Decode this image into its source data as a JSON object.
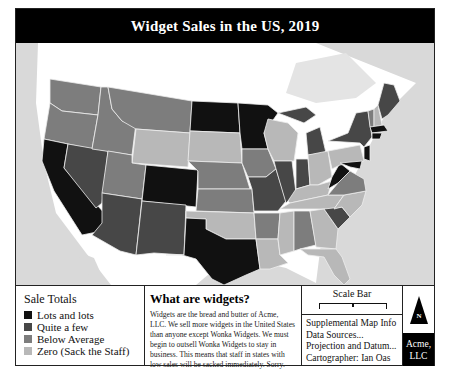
{
  "title": "Widget Sales in the US, 2019",
  "colors": {
    "lots": "#111111",
    "quite": "#474747",
    "below": "#7d7d7d",
    "zero": "#b8b8b8",
    "water": "#d9d9d9",
    "land_other": "#ffffff"
  },
  "legend": {
    "title": "Sale Totals",
    "items": [
      {
        "label": "Lots and lots",
        "color": "#111111"
      },
      {
        "label": "Quite a few",
        "color": "#474747"
      },
      {
        "label": "Below Average",
        "color": "#7d7d7d"
      },
      {
        "label": "Zero (Sack the Staff)",
        "color": "#b8b8b8"
      }
    ]
  },
  "about": {
    "title": "What are widgets?",
    "body": "Widgets are the bread and butter of Acme, LLC. We sell more widgets in the United States than anyone except Wonka Widgets. We must begin to outsell Wonka Widgets to stay in business. This means that staff in states with low sales will be sacked immediately. Sorry."
  },
  "scale_bar": {
    "label": "Scale Bar"
  },
  "supplemental": {
    "lines": [
      "Supplemental Map Info",
      "Data Sources...",
      "Projection and Datum...",
      "Cartographer: Ian Oas"
    ]
  },
  "north_arrow": {
    "label": "N"
  },
  "company": {
    "line1": "Acme,",
    "line2": "LLC"
  },
  "states": {
    "WA": "below",
    "OR": "below",
    "CA": "lots",
    "NV": "quite",
    "ID": "below",
    "MT": "below",
    "WY": "zero",
    "UT": "below",
    "AZ": "quite",
    "CO": "lots",
    "NM": "quite",
    "ND": "lots",
    "SD": "zero",
    "NE": "below",
    "KS": "below",
    "OK": "zero",
    "TX": "lots",
    "MN": "lots",
    "IA": "below",
    "MO": "quite",
    "AR": "below",
    "LA": "zero",
    "WI": "zero",
    "IL": "quite",
    "MI": "quite",
    "IN": "quite",
    "OH": "zero",
    "KY": "zero",
    "TN": "zero",
    "MS": "zero",
    "AL": "below",
    "GA": "zero",
    "FL": "zero",
    "SC": "quite",
    "NC": "zero",
    "VA": "below",
    "WV": "lots",
    "PA": "zero",
    "NY": "quite",
    "VT": "below",
    "NH": "zero",
    "ME": "quite",
    "MA": "lots",
    "CT": "lots",
    "NJ": "lots",
    "MD": "lots"
  }
}
